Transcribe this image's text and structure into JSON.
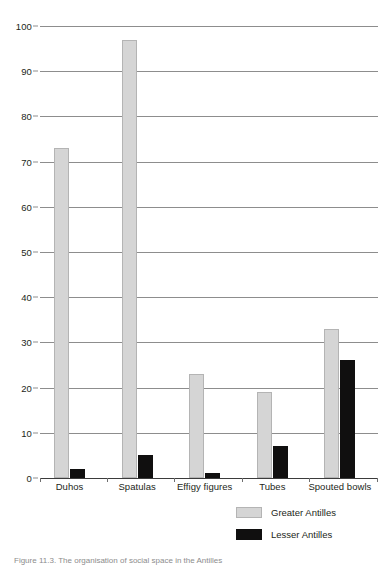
{
  "figure": {
    "caption": "Figure 11.3. The organisation of social space in the Antilles"
  },
  "chart_data": {
    "type": "bar",
    "title": "",
    "subtitle": "",
    "xlabel": "",
    "ylabel": "",
    "categories": [
      "Duhos",
      "Spatulas",
      "Effigy figures",
      "Tubes",
      "Spouted bowls"
    ],
    "series": [
      {
        "name": "Greater Antilles",
        "color": "#d5d5d5",
        "values": [
          73,
          97,
          23,
          19,
          33
        ]
      },
      {
        "name": "Lesser Antilles",
        "color": "#100f0f",
        "values": [
          2,
          5,
          1,
          7,
          26
        ]
      }
    ],
    "ylim": [
      0,
      100
    ],
    "ytick_step": 10,
    "yticks": [
      0,
      10,
      20,
      30,
      40,
      50,
      60,
      70,
      80,
      90,
      100
    ],
    "ytick_labels": [
      "0",
      "10",
      "20",
      "30",
      "40",
      "50",
      "60",
      "70",
      "80",
      "90",
      "100"
    ],
    "grid": true,
    "grid_axis": "y",
    "grid_color": "#8d8d8d",
    "legend_position": "bottom-right",
    "legend_entries": [
      "Greater Antilles",
      "Lesser Antilles"
    ],
    "background": "#ffffff"
  }
}
